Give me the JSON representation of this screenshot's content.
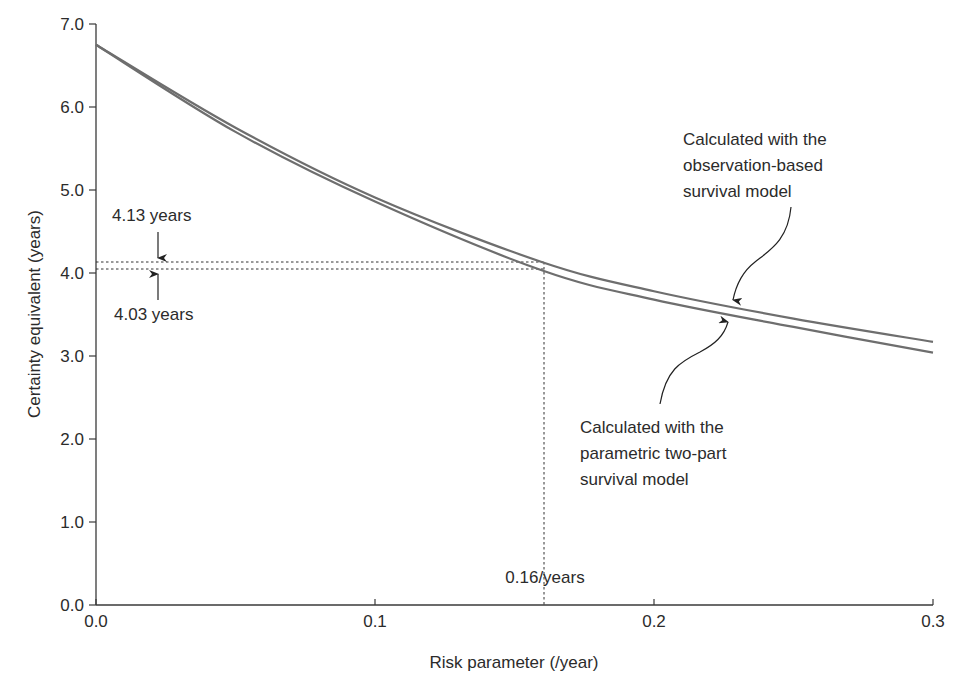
{
  "chart_data": {
    "type": "line",
    "title": "",
    "xlabel": "Risk parameter (/year)",
    "ylabel": "Certainty equivalent (years)",
    "xlim": [
      0.0,
      0.3
    ],
    "ylim": [
      0.0,
      7.0
    ],
    "x_ticks": [
      "0.0",
      "0.1",
      "0.2",
      "0.3"
    ],
    "y_ticks": [
      "0.0",
      "1.0",
      "2.0",
      "3.0",
      "4.0",
      "5.0",
      "6.0",
      "7.0"
    ],
    "grid": false,
    "legend": null,
    "x": [
      0.0,
      0.05,
      0.1,
      0.16,
      0.2,
      0.25,
      0.3
    ],
    "series": [
      {
        "name": "Calculated with the observation-based survival model",
        "values": [
          6.75,
          5.75,
          4.91,
          4.13,
          3.78,
          3.45,
          3.17
        ]
      },
      {
        "name": "Calculated with the parametric two-part survival model",
        "values": [
          6.75,
          5.7,
          4.86,
          4.03,
          3.68,
          3.35,
          3.04
        ]
      }
    ],
    "annotations": [
      {
        "text": "4.13 years",
        "type": "value-marker",
        "y": 4.13
      },
      {
        "text": "4.03 years",
        "type": "value-marker",
        "y": 4.03
      },
      {
        "text": "0.16/years",
        "type": "vertical-marker",
        "x": 0.16
      },
      {
        "text": "Calculated with the observation-based survival model",
        "target_series": 0
      },
      {
        "text": "Calculated with the parametric two-part survival model",
        "target_series": 1
      }
    ]
  },
  "labels": {
    "xlabel": "Risk parameter (/year)",
    "ylabel": "Certainty equivalent (years)",
    "upper_value": "4.13 years",
    "lower_value": "4.03 years",
    "risk_marker": "0.16/years",
    "obs_line1": "Calculated with the",
    "obs_line2": "observation-based",
    "obs_line3": "survival model",
    "par_line1": "Calculated with the",
    "par_line2": "parametric two-part",
    "par_line3": "survival model"
  },
  "colors": {
    "curve": "#6e6e6e",
    "axis": "#3a3a3a",
    "text": "#2b2b2b"
  }
}
